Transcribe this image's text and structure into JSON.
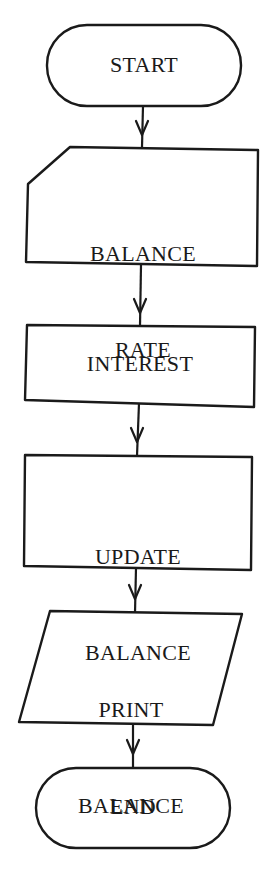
{
  "diagram": {
    "type": "flowchart",
    "colors": {
      "stroke": "#1a1a1a",
      "fill": "#ffffff",
      "background": "#ffffff"
    },
    "nodes": [
      {
        "id": "start",
        "shape": "terminator",
        "label": "START"
      },
      {
        "id": "input",
        "shape": "manual-input",
        "label_lines": [
          "BALANCE",
          "RATE"
        ]
      },
      {
        "id": "interest",
        "shape": "process",
        "label": "INTEREST"
      },
      {
        "id": "update",
        "shape": "process",
        "label_lines": [
          "UPDATE",
          "BALANCE"
        ]
      },
      {
        "id": "print",
        "shape": "input-output",
        "label_lines": [
          "PRINT",
          "BALANCE"
        ]
      },
      {
        "id": "end",
        "shape": "terminator",
        "label": "END"
      }
    ],
    "edges": [
      {
        "from": "start",
        "to": "input"
      },
      {
        "from": "input",
        "to": "interest"
      },
      {
        "from": "interest",
        "to": "update"
      },
      {
        "from": "update",
        "to": "print"
      },
      {
        "from": "print",
        "to": "end"
      }
    ]
  }
}
